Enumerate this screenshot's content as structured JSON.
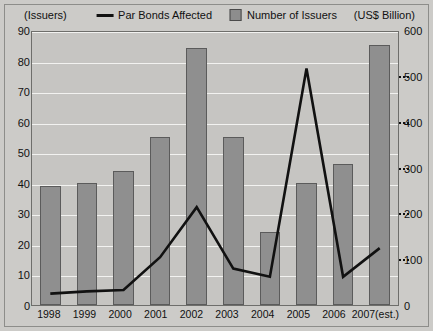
{
  "header": {
    "left_axis_unit": "(Issuers)",
    "right_axis_unit": "(US$ Billion)"
  },
  "legend": {
    "items": [
      {
        "label": "Par Bonds Affected",
        "marker": "line",
        "color": "#111111"
      },
      {
        "label": "Number of Issuers",
        "marker": "square",
        "color": "#8f8f8f"
      }
    ]
  },
  "chart_data": {
    "type": "bar",
    "title": "",
    "subtitle": "",
    "xlabel": "",
    "ylabel": "(Issuers)",
    "y2label": "(US$ Billion)",
    "categories": [
      "1998",
      "1999",
      "2000",
      "2001",
      "2002",
      "2003",
      "2004",
      "2005",
      "2006",
      "2007(est.)"
    ],
    "ylim": [
      0,
      90
    ],
    "yticks": [
      0,
      10,
      20,
      30,
      40,
      50,
      60,
      70,
      80,
      90
    ],
    "y2lim": [
      0,
      600
    ],
    "y2ticks": [
      0,
      100,
      200,
      300,
      400,
      500,
      600
    ],
    "grid": true,
    "legend_position": "top-center",
    "series": [
      {
        "name": "Number of Issuers",
        "type": "bar",
        "axis": "left",
        "color": "#8f8f8f",
        "values": [
          39,
          40,
          44,
          55,
          84,
          55,
          24,
          40,
          46,
          85
        ]
      },
      {
        "name": "Par Bonds Affected",
        "type": "line",
        "axis": "right",
        "color": "#111111",
        "values": [
          25,
          30,
          33,
          105,
          215,
          80,
          62,
          520,
          62,
          125
        ]
      }
    ]
  }
}
